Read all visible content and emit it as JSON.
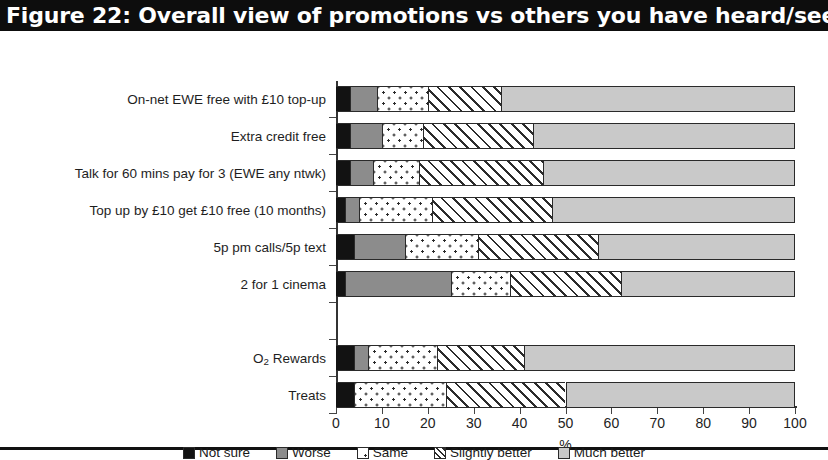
{
  "figure": {
    "title": "Figure 22: Overall view of promotions vs others you have heard/seen"
  },
  "chart_data": {
    "type": "bar",
    "orientation": "horizontal",
    "stacked": true,
    "stack_mode": "percent",
    "title": "Figure 22: Overall view of promotions vs others you have heard/seen",
    "xlabel": "%",
    "ylabel": "",
    "xlim": [
      0,
      100
    ],
    "xticks": [
      0,
      10,
      20,
      30,
      40,
      50,
      60,
      70,
      80,
      90,
      100
    ],
    "xtick_labels": [
      "0",
      "10",
      "20",
      "30",
      "40",
      "50",
      "60",
      "70",
      "80",
      "90",
      "100"
    ],
    "grid": false,
    "legend_position": "bottom",
    "categories": [
      "On-net EWE free with £10 top-up",
      "Extra credit free",
      "Talk for 60 mins pay for 3 (EWE any ntwk)",
      "Top up by £10 get £10 free (10 months)",
      "5p pm calls/5p text",
      "2 for 1 cinema",
      "",
      "O2 Rewards",
      "Treats"
    ],
    "series": [
      {
        "name": "Not sure",
        "values": [
          3,
          3,
          3,
          2,
          4,
          2,
          0,
          4,
          4
        ]
      },
      {
        "name": "Worse",
        "values": [
          6,
          7,
          5,
          3,
          11,
          23,
          0,
          3,
          0
        ]
      },
      {
        "name": "Same",
        "values": [
          11,
          9,
          10,
          16,
          16,
          13,
          0,
          15,
          20
        ]
      },
      {
        "name": "Slightly better",
        "values": [
          16,
          24,
          27,
          26,
          26,
          24,
          0,
          19,
          26
        ]
      },
      {
        "name": "Much better",
        "values": [
          64,
          57,
          55,
          53,
          43,
          38,
          0,
          59,
          50
        ]
      }
    ],
    "legend_entries": [
      "Not sure",
      "Worse",
      "Same",
      "Slightly better",
      "Much better"
    ]
  },
  "axis": {
    "x_title": "%"
  },
  "categories_display": [
    {
      "label": "On-net EWE free with £10 top-up",
      "subscript": false
    },
    {
      "label": "Extra credit free",
      "subscript": false
    },
    {
      "label": "Talk for 60 mins pay for 3 (EWE any ntwk)",
      "subscript": false
    },
    {
      "label": "Top up by £10 get £10 free (10 months)",
      "subscript": false
    },
    {
      "label": "5p pm calls/5p text",
      "subscript": false
    },
    {
      "label": "2 for 1 cinema",
      "subscript": false
    },
    {
      "label": "",
      "subscript": false
    },
    {
      "label": "O2 Rewards",
      "subscript": true
    },
    {
      "label": "Treats",
      "subscript": false
    }
  ],
  "legend": {
    "items": [
      {
        "label": "Not sure",
        "swatch": "s-notsure",
        "color": "#121212"
      },
      {
        "label": "Worse",
        "swatch": "s-worse",
        "color": "#8c8c8c"
      },
      {
        "label": "Same",
        "swatch": "s-same",
        "color": "#ffffff"
      },
      {
        "label": "Slightly better",
        "swatch": "s-slightly",
        "color": "#ffffff"
      },
      {
        "label": "Much better",
        "swatch": "s-much",
        "color": "#c9c9c9"
      }
    ]
  }
}
